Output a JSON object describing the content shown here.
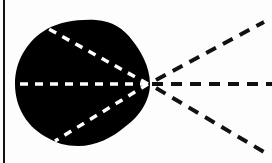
{
  "diagram": {
    "type": "polar-pickup-pattern",
    "colors": {
      "background": "#fdfdfd",
      "lobe_fill": "#000000",
      "dash_inside": "#ffffff",
      "dash_outside": "#111111",
      "border": "#111111"
    },
    "origin": {
      "x": 148,
      "y": 84
    },
    "rays": [
      {
        "name": "left-horizontal",
        "to": {
          "x": 14,
          "y": 84
        },
        "style": "white-dashed"
      },
      {
        "name": "upper-left",
        "to": {
          "x": 47,
          "y": 28
        },
        "style": "white-dashed"
      },
      {
        "name": "lower-left",
        "to": {
          "x": 55,
          "y": 141
        },
        "style": "white-dashed"
      },
      {
        "name": "right-horizontal",
        "to": {
          "x": 272,
          "y": 84
        },
        "style": "black-dashed"
      },
      {
        "name": "upper-right",
        "to": {
          "x": 264,
          "y": 22
        },
        "style": "black-dashed"
      },
      {
        "name": "lower-right",
        "to": {
          "x": 264,
          "y": 152
        },
        "style": "black-dashed"
      }
    ]
  }
}
